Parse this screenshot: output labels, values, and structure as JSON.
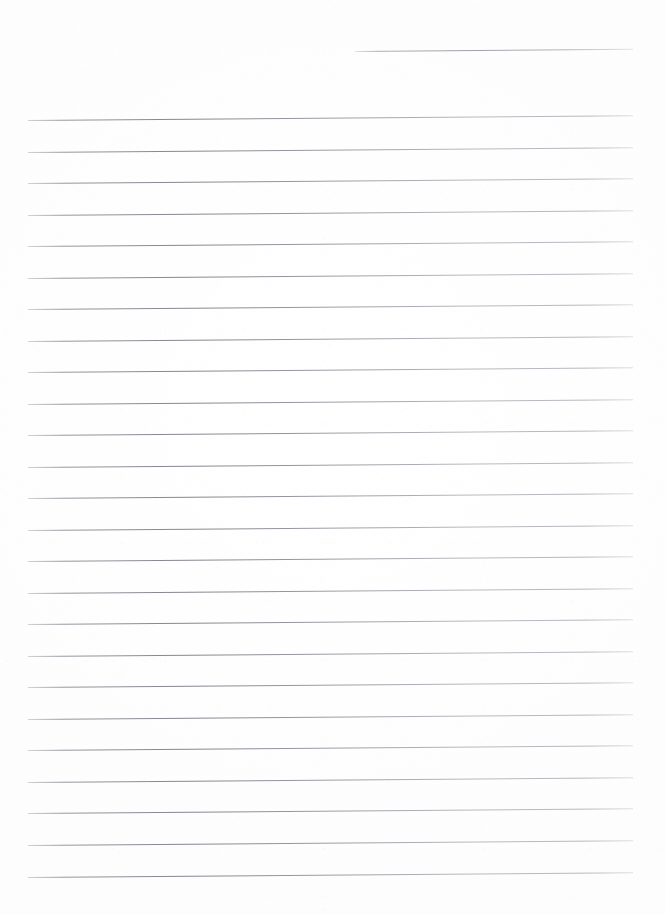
{
  "document": {
    "kind": "scanned-lined-paper",
    "title": "Blank lined notebook page",
    "content_text": "",
    "page_width": 665,
    "page_height": 915,
    "background_color": "#fefefe",
    "rule_color": "#8a8a94",
    "has_handwriting": false,
    "has_printed_text": false
  },
  "ruling": {
    "left_margin_x": 28,
    "right_edge_x": 633,
    "line_spacing": 31.5,
    "first_full_line_y": 120,
    "last_full_line_y": 877,
    "tilt_degrees": -0.45,
    "full_line_count": 25,
    "partial_line_count": 1
  },
  "lines": [
    {
      "id": "rule-partial-top",
      "x": 355,
      "y": 51,
      "width": 278,
      "partial": true,
      "label": "top-right partial rule"
    },
    {
      "id": "rule-01",
      "x": 28,
      "y": 120,
      "width": 605,
      "partial": false,
      "label": "rule 1"
    },
    {
      "id": "rule-02",
      "x": 28,
      "y": 151.5,
      "width": 605,
      "partial": false,
      "label": "rule 2"
    },
    {
      "id": "rule-03",
      "x": 28,
      "y": 183,
      "width": 605,
      "partial": false,
      "label": "rule 3"
    },
    {
      "id": "rule-04",
      "x": 28,
      "y": 214.5,
      "width": 605,
      "partial": false,
      "label": "rule 4"
    },
    {
      "id": "rule-05",
      "x": 28,
      "y": 246,
      "width": 605,
      "partial": false,
      "label": "rule 5"
    },
    {
      "id": "rule-06",
      "x": 28,
      "y": 277.5,
      "width": 605,
      "partial": false,
      "label": "rule 6"
    },
    {
      "id": "rule-07",
      "x": 28,
      "y": 309,
      "width": 605,
      "partial": false,
      "label": "rule 7"
    },
    {
      "id": "rule-08",
      "x": 28,
      "y": 340.5,
      "width": 605,
      "partial": false,
      "label": "rule 8"
    },
    {
      "id": "rule-09",
      "x": 28,
      "y": 372,
      "width": 605,
      "partial": false,
      "label": "rule 9"
    },
    {
      "id": "rule-10",
      "x": 28,
      "y": 403.5,
      "width": 605,
      "partial": false,
      "label": "rule 10"
    },
    {
      "id": "rule-11",
      "x": 28,
      "y": 435,
      "width": 605,
      "partial": false,
      "label": "rule 11"
    },
    {
      "id": "rule-12",
      "x": 28,
      "y": 466.5,
      "width": 605,
      "partial": false,
      "label": "rule 12"
    },
    {
      "id": "rule-13",
      "x": 28,
      "y": 498,
      "width": 605,
      "partial": false,
      "label": "rule 13"
    },
    {
      "id": "rule-14",
      "x": 28,
      "y": 529.5,
      "width": 605,
      "partial": false,
      "label": "rule 14"
    },
    {
      "id": "rule-15",
      "x": 28,
      "y": 561,
      "width": 605,
      "partial": false,
      "label": "rule 15"
    },
    {
      "id": "rule-16",
      "x": 28,
      "y": 592.5,
      "width": 605,
      "partial": false,
      "label": "rule 16"
    },
    {
      "id": "rule-17",
      "x": 28,
      "y": 624,
      "width": 605,
      "partial": false,
      "label": "rule 17"
    },
    {
      "id": "rule-18",
      "x": 28,
      "y": 655.5,
      "width": 605,
      "partial": false,
      "label": "rule 18"
    },
    {
      "id": "rule-19",
      "x": 28,
      "y": 687,
      "width": 605,
      "partial": false,
      "label": "rule 19"
    },
    {
      "id": "rule-20",
      "x": 28,
      "y": 718.5,
      "width": 605,
      "partial": false,
      "label": "rule 20"
    },
    {
      "id": "rule-21",
      "x": 28,
      "y": 750,
      "width": 605,
      "partial": false,
      "label": "rule 21"
    },
    {
      "id": "rule-22",
      "x": 28,
      "y": 781.5,
      "width": 605,
      "partial": false,
      "label": "rule 22"
    },
    {
      "id": "rule-23",
      "x": 28,
      "y": 813,
      "width": 605,
      "partial": false,
      "label": "rule 23"
    },
    {
      "id": "rule-24",
      "x": 28,
      "y": 845,
      "width": 605,
      "partial": false,
      "label": "rule 24"
    },
    {
      "id": "rule-25",
      "x": 28,
      "y": 877,
      "width": 605,
      "partial": false,
      "label": "rule 25"
    }
  ]
}
